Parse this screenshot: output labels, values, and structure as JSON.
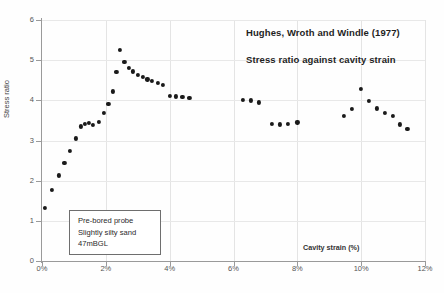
{
  "chart_data": {
    "type": "scatter",
    "title": "",
    "annotations": {
      "citation": "Hughes, Wroth and Windle (1977)",
      "subject": "Stress ratio against cavity strain",
      "note_box": [
        "Pre-bored probe",
        "Slightly silty sand",
        "47mBGL"
      ]
    },
    "xlabel": "Cavity strain (%)",
    "ylabel": "Stress ratio",
    "xlim": [
      0,
      12
    ],
    "ylim": [
      0,
      6
    ],
    "xticks": [
      0,
      2,
      4,
      6,
      8,
      10,
      12
    ],
    "xticklabels": [
      "0%",
      "2%",
      "4%",
      "6%",
      "8%",
      "10%",
      "12%"
    ],
    "yticks": [
      0,
      1,
      2,
      3,
      4,
      5,
      6
    ],
    "yticklabels": [
      "0",
      "1",
      "2",
      "3",
      "4",
      "5",
      "6"
    ],
    "grid": true,
    "legend": null,
    "marker_color": "#1a1a1a",
    "series": [
      {
        "name": "Stress ratio",
        "x": [
          0.08,
          0.32,
          0.52,
          0.7,
          0.88,
          1.05,
          1.22,
          1.35,
          1.48,
          1.6,
          1.78,
          1.95,
          2.08,
          2.22,
          2.33,
          2.45,
          2.58,
          2.72,
          2.86,
          3.0,
          3.15,
          3.3,
          3.45,
          3.62,
          3.8,
          4.0,
          4.2,
          4.4,
          4.62,
          6.3,
          6.55,
          6.8,
          7.2,
          7.45,
          7.7,
          8.0,
          9.45,
          9.72,
          10.0,
          10.25,
          10.5,
          10.75,
          11.0,
          11.22,
          11.45
        ],
        "y": [
          1.32,
          1.78,
          2.13,
          2.45,
          2.74,
          3.05,
          3.35,
          3.42,
          3.44,
          3.38,
          3.47,
          3.68,
          3.92,
          4.22,
          4.7,
          5.25,
          4.95,
          4.8,
          4.72,
          4.64,
          4.58,
          4.52,
          4.48,
          4.44,
          4.38,
          4.12,
          4.1,
          4.08,
          4.07,
          4.02,
          4.0,
          3.95,
          3.42,
          3.4,
          3.42,
          3.45,
          3.62,
          3.78,
          4.28,
          3.98,
          3.8,
          3.68,
          3.62,
          3.4,
          3.28
        ]
      }
    ]
  }
}
